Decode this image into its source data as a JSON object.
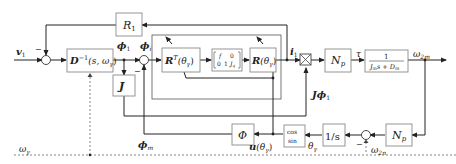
{
  "diagram": {
    "type": "control-block-diagram",
    "blocks": {
      "r1": "R",
      "r1_sub": "1",
      "d_inv": "D",
      "d_inv_sup": "−1",
      "d_inv_arg": "(s, ω",
      "d_inv_arg_sub": "γ",
      "d_inv_arg_end": ")",
      "j": "J",
      "rt": "R",
      "rt_sup": "T",
      "rt_arg": "(θ",
      "rt_arg_sub": "γ",
      "rt_arg_end": ")",
      "matrix_r1c1": "f",
      "matrix_r1c2": "0",
      "matrix_r2c1": "0",
      "matrix_r2c2": "1",
      "matrix_r2c3": "J",
      "matrix_r2c3_sub": "q",
      "r": "R",
      "r_arg": "(θ",
      "r_arg_sub": "γ",
      "r_arg_end": ")",
      "np_top": "N",
      "np_top_sub": "p",
      "plant_num": "1",
      "plant_den": "J",
      "plant_den_sub1": "m",
      "plant_den_mid": "s + D",
      "plant_den_sub2": "m",
      "phi_block": "Φ",
      "cossin_top": "cos",
      "cossin_bottom": "sin",
      "integrator": "1/s",
      "np_bottom": "N",
      "np_bottom_sub": "p"
    },
    "signals": {
      "v1": "v",
      "v1_sub": "1",
      "phi1": "ϕ",
      "phi1_sub": "1",
      "phii": "ϕ",
      "phii_sub": "i",
      "i1": "i",
      "i1_sub": "1",
      "tau": "τ",
      "omega2m": "ω",
      "omega2m_sub": "2m",
      "jphi1": "Jϕ",
      "jphi1_sub": "1",
      "phim": "ϕ",
      "phim_sub": "m",
      "u_theta": "u",
      "u_theta_arg": "(θ",
      "u_theta_sub": "γ",
      "u_theta_end": ")",
      "theta_gamma": "θ",
      "theta_gamma_sub": "γ",
      "omega2n": "ω",
      "omega2n_sub": "2n",
      "omega_gamma": "ω",
      "omega_gamma_sub": "γ",
      "minus": "−"
    }
  }
}
